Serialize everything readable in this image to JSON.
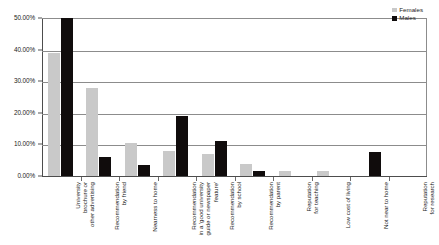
{
  "chart_data": {
    "type": "bar",
    "title": "",
    "subtitle": "",
    "xlabel": "",
    "ylabel": "",
    "ylim": [
      0,
      50
    ],
    "y_ticks": [
      "0.00%",
      "10.00%",
      "20.00%",
      "30.00%",
      "40.00%",
      "50.00%"
    ],
    "y_tick_values": [
      0,
      10,
      20,
      30,
      40,
      50
    ],
    "grid": "horizontal",
    "legend_position": "top-right",
    "value_suffix": "%",
    "categories": [
      "University brochure or other advertising",
      "Recommendation by friend",
      "Nearness to home",
      "Recommendation in a 'good university guide or newspaper feature'",
      "Recommendation by school",
      "Recommendation by parent",
      "Reputation for teaching",
      "Low cost of living",
      "Not near to home",
      "Reputation for research"
    ],
    "category_lines": [
      [
        "University",
        "brochure or",
        "other advertising"
      ],
      [
        "Recommendation",
        "by friend"
      ],
      [
        "Nearness to home"
      ],
      [
        "Recommendation",
        "in a 'good university",
        "guide or newspaper",
        "feature'"
      ],
      [
        "Recommendation",
        "by school"
      ],
      [
        "Recommendation",
        "by parent"
      ],
      [
        "Reputation",
        "for teaching"
      ],
      [
        "Low cost of living"
      ],
      [
        "Not near to home"
      ],
      [
        "Reputation",
        "for research"
      ]
    ],
    "series": [
      {
        "name": "Females",
        "color": "#c9c9c9",
        "values": [
          39.0,
          27.8,
          10.5,
          8.0,
          7.0,
          3.9,
          1.5,
          1.5,
          0.0,
          0.0
        ]
      },
      {
        "name": "Males",
        "color": "#100c0c",
        "values": [
          50.0,
          6.1,
          3.5,
          19.0,
          11.0,
          1.7,
          0.0,
          0.0,
          7.5,
          0.0
        ]
      }
    ]
  },
  "legend": {
    "entries": [
      {
        "label": "Females",
        "swatch": "legend-swatch-female"
      },
      {
        "label": "Males",
        "swatch": "legend-swatch-male"
      }
    ]
  }
}
